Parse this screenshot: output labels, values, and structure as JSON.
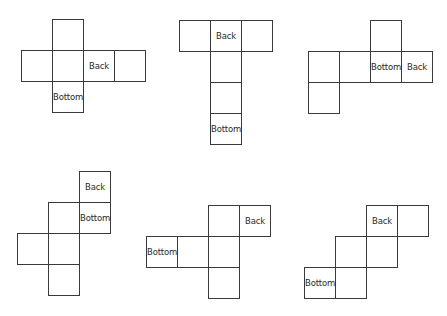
{
  "diagram": {
    "type": "cube-nets",
    "cell_size": 32,
    "line_color": "#3a3a3a",
    "labels": {
      "back": "Back",
      "bottom": "Bottom"
    },
    "nets": [
      {
        "id": 1,
        "origin": [
          21,
          19
        ],
        "cells": [
          {
            "c": 1,
            "r": 0,
            "label": ""
          },
          {
            "c": 0,
            "r": 1,
            "label": ""
          },
          {
            "c": 1,
            "r": 1,
            "label": ""
          },
          {
            "c": 2,
            "r": 1,
            "label": "Back"
          },
          {
            "c": 3,
            "r": 1,
            "label": ""
          },
          {
            "c": 1,
            "r": 2,
            "label": "Bottom"
          }
        ]
      },
      {
        "id": 2,
        "origin": [
          179,
          20
        ],
        "cells": [
          {
            "c": 0,
            "r": 0,
            "label": ""
          },
          {
            "c": 1,
            "r": 0,
            "label": "Back"
          },
          {
            "c": 2,
            "r": 0,
            "label": ""
          },
          {
            "c": 1,
            "r": 1,
            "label": ""
          },
          {
            "c": 1,
            "r": 2,
            "label": ""
          },
          {
            "c": 1,
            "r": 3,
            "label": "Bottom"
          }
        ]
      },
      {
        "id": 3,
        "origin": [
          308,
          20
        ],
        "cells": [
          {
            "c": 2,
            "r": 0,
            "label": ""
          },
          {
            "c": 0,
            "r": 1,
            "label": ""
          },
          {
            "c": 1,
            "r": 1,
            "label": ""
          },
          {
            "c": 2,
            "r": 1,
            "label": "Bottom"
          },
          {
            "c": 3,
            "r": 1,
            "label": "Back"
          },
          {
            "c": 0,
            "r": 2,
            "label": ""
          }
        ]
      },
      {
        "id": 4,
        "origin": [
          17,
          171
        ],
        "cells": [
          {
            "c": 2,
            "r": 0,
            "label": "Back"
          },
          {
            "c": 1,
            "r": 1,
            "label": ""
          },
          {
            "c": 2,
            "r": 1,
            "label": "Bottom"
          },
          {
            "c": 0,
            "r": 2,
            "label": ""
          },
          {
            "c": 1,
            "r": 2,
            "label": ""
          },
          {
            "c": 1,
            "r": 3,
            "label": ""
          }
        ]
      },
      {
        "id": 5,
        "origin": [
          146,
          205
        ],
        "cells": [
          {
            "c": 2,
            "r": 0,
            "label": ""
          },
          {
            "c": 3,
            "r": 0,
            "label": "Back"
          },
          {
            "c": 0,
            "r": 1,
            "label": "Bottom"
          },
          {
            "c": 1,
            "r": 1,
            "label": ""
          },
          {
            "c": 2,
            "r": 1,
            "label": ""
          },
          {
            "c": 2,
            "r": 2,
            "label": ""
          }
        ]
      },
      {
        "id": 6,
        "origin": [
          304,
          205
        ],
        "cells": [
          {
            "c": 2,
            "r": 0,
            "label": "Back"
          },
          {
            "c": 3,
            "r": 0,
            "label": ""
          },
          {
            "c": 1,
            "r": 1,
            "label": ""
          },
          {
            "c": 2,
            "r": 1,
            "label": ""
          },
          {
            "c": 0,
            "r": 2,
            "label": "Bottom"
          },
          {
            "c": 1,
            "r": 2,
            "label": ""
          }
        ]
      }
    ]
  }
}
